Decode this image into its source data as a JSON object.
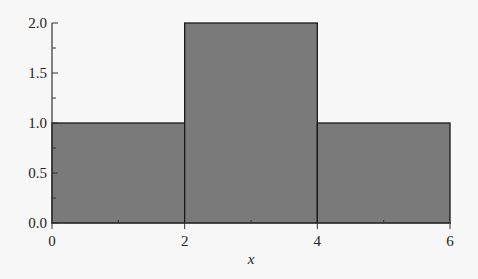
{
  "chart_data": {
    "type": "bar",
    "subtype": "histogram",
    "title": "",
    "xlabel": "x",
    "ylabel": "",
    "bins": [
      {
        "x0": 0,
        "x1": 2,
        "value": 1.0
      },
      {
        "x0": 2,
        "x1": 4,
        "value": 2.0
      },
      {
        "x0": 4,
        "x1": 6,
        "value": 1.0
      }
    ],
    "categories": [
      "0-2",
      "2-4",
      "4-6"
    ],
    "values": [
      1.0,
      2.0,
      1.0
    ],
    "xlim": [
      0,
      6
    ],
    "ylim": [
      0,
      2.0
    ],
    "x_ticks": [
      "0",
      "2",
      "4",
      "6"
    ],
    "y_ticks": [
      "0.0",
      "0.5",
      "1.0",
      "1.5",
      "2.0"
    ],
    "grid": false,
    "legend": null,
    "colors": {
      "bar_fill": "#7a7a7a",
      "bar_edge": "#1a1a1a",
      "axis": "#333333",
      "background": "#f7f7f7"
    }
  }
}
